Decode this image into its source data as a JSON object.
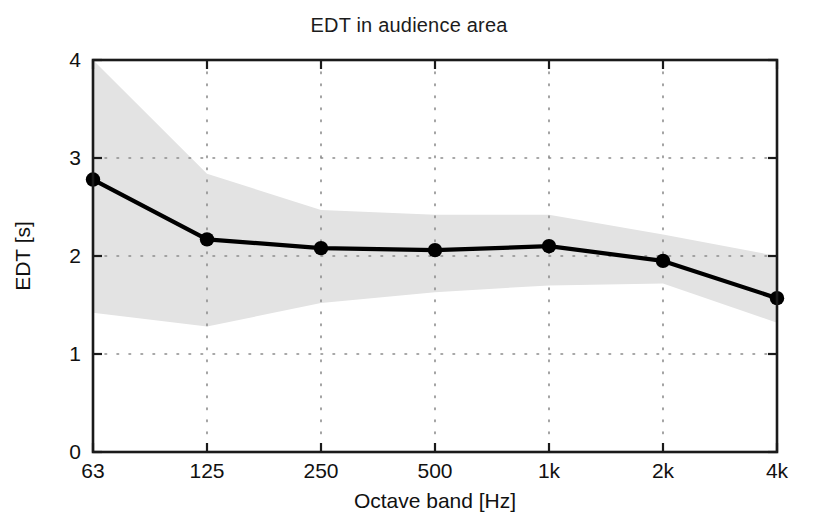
{
  "chart_data": {
    "type": "line",
    "title": "EDT in audience area",
    "xlabel": "Octave band [Hz]",
    "ylabel": "EDT [s]",
    "categories": [
      "63",
      "125",
      "250",
      "500",
      "1k",
      "2k",
      "4k"
    ],
    "x_tick_labels": [
      "63",
      "125",
      "250",
      "500",
      "1k",
      "2k",
      "4k"
    ],
    "y_tick_labels": [
      "0",
      "1",
      "2",
      "3",
      "4"
    ],
    "y_ticks": [
      0,
      1,
      2,
      3,
      4
    ],
    "ylim": [
      0,
      4
    ],
    "grid": true,
    "grid_style": "dotted",
    "legend": null,
    "series": [
      {
        "name": "EDT mean",
        "marker": "circle",
        "color": "#000000",
        "values": [
          2.78,
          2.17,
          2.08,
          2.06,
          2.1,
          1.95,
          1.57
        ]
      }
    ],
    "band": {
      "name": "spread",
      "color": "#e3e3e3",
      "upper": [
        4.0,
        2.84,
        2.47,
        2.42,
        2.42,
        2.22,
        2.0
      ],
      "lower": [
        1.42,
        1.28,
        1.52,
        1.63,
        1.7,
        1.72,
        1.32
      ],
      "note": "upper bound at 63 Hz is clipped at the top of the axis"
    }
  },
  "axes": {
    "top_label": "4",
    "bottom_label": "0"
  },
  "colors": {
    "line": "#000000",
    "band": "#e3e3e3",
    "grid": "#8c8c8c",
    "frame": "#1a1a1a",
    "background": "#ffffff"
  }
}
